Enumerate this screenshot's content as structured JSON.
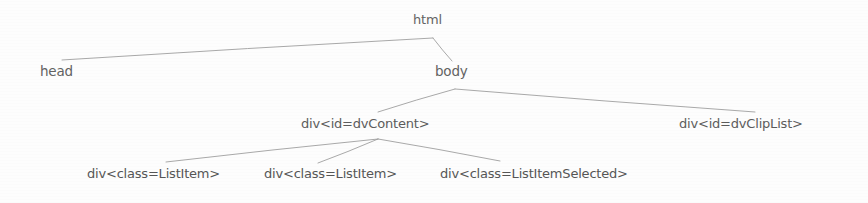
{
  "diagram": {
    "type": "dom-tree",
    "title": "",
    "background_color": "#fdfdfd",
    "line_color": "#9a9a9a",
    "text_color": "#5c5c5c",
    "nodes": [
      {
        "id": "html",
        "label": "html",
        "level": 0,
        "x": 413,
        "y": 12,
        "anchor_x": 433,
        "anchor_y": 37
      },
      {
        "id": "head",
        "label": "head",
        "level": 1,
        "x": 40,
        "y": 63,
        "anchor_x": 62,
        "anchor_y": 60
      },
      {
        "id": "body",
        "label": "body",
        "level": 1,
        "x": 435,
        "y": 63,
        "anchor_x": 455,
        "anchor_y": 89
      },
      {
        "id": "dvContent",
        "label": "div<id=dvContent>",
        "level": 2,
        "x": 301,
        "y": 116,
        "anchor_x": 378,
        "anchor_y": 138
      },
      {
        "id": "dvClipList",
        "label": "div<id=dvClipList>",
        "level": 2,
        "x": 679,
        "y": 116,
        "anchor_x": 755,
        "anchor_y": 112
      },
      {
        "id": "listItem1",
        "label": "div<class=ListItem>",
        "level": 3,
        "x": 87,
        "y": 166,
        "anchor_x": 166,
        "anchor_y": 162
      },
      {
        "id": "listItem2",
        "label": "div<class=ListItem>",
        "level": 3,
        "x": 264,
        "y": 166,
        "anchor_x": 318,
        "anchor_y": 163
      },
      {
        "id": "listItemSelected",
        "label": "div<class=ListItemSelected>",
        "level": 3,
        "x": 440,
        "y": 166,
        "anchor_x": 500,
        "anchor_y": 161
      }
    ],
    "edges": [
      {
        "from": "html",
        "to": "head",
        "x1": 433,
        "y1": 38,
        "x2": 62,
        "y2": 60
      },
      {
        "from": "html",
        "to": "body",
        "x1": 433,
        "y1": 38,
        "x2": 452,
        "y2": 61
      },
      {
        "from": "body",
        "to": "dvContent",
        "x1": 455,
        "y1": 89,
        "x2": 378,
        "y2": 112
      },
      {
        "from": "body",
        "to": "dvClipList",
        "x1": 455,
        "y1": 89,
        "x2": 755,
        "y2": 112
      },
      {
        "from": "dvContent",
        "to": "listItem1",
        "x1": 378,
        "y1": 139,
        "x2": 166,
        "y2": 162
      },
      {
        "from": "dvContent",
        "to": "listItem2",
        "x1": 378,
        "y1": 139,
        "x2": 318,
        "y2": 163
      },
      {
        "from": "dvContent",
        "to": "listItemSelected",
        "x1": 378,
        "y1": 139,
        "x2": 500,
        "y2": 161
      }
    ]
  }
}
